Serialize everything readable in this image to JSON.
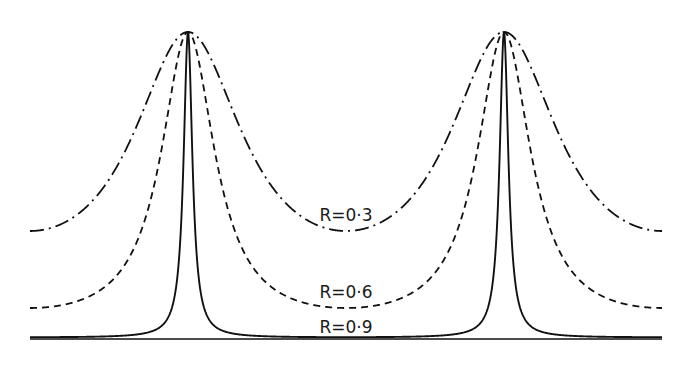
{
  "chart_data": {
    "type": "line",
    "title": "",
    "xlabel": "",
    "ylabel": "",
    "grid": false,
    "legend": "inline labels",
    "x_range_px": [
      30,
      662
    ],
    "peak_positions_px": [
      188,
      504
    ],
    "ylim": [
      0,
      1
    ],
    "series": [
      {
        "name": "R=0·3",
        "label": "R=0·3",
        "style": "dash-dot",
        "min_transmission": 0.35,
        "max_transmission": 1.0,
        "F": 1.86,
        "label_pos": [
          346,
          215
        ]
      },
      {
        "name": "R=0·6",
        "label": "R=0·6",
        "style": "dashed",
        "min_transmission": 0.098,
        "max_transmission": 1.0,
        "F": 9.2,
        "label_pos": [
          346,
          292
        ]
      },
      {
        "name": "R=0·9",
        "label": "R=0·9",
        "style": "solid",
        "min_transmission": 0.003,
        "max_transmission": 1.0,
        "F": 360,
        "label_pos": [
          346,
          327
        ]
      }
    ]
  }
}
